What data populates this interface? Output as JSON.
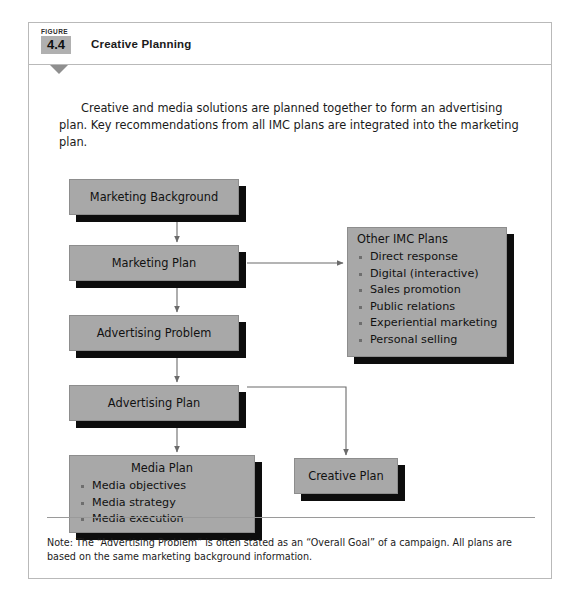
{
  "figure": {
    "badge_label": "FIGURE",
    "number": "4.4",
    "title": "Creative Planning",
    "intro": "Creative and media solutions are planned together to form an advertising plan. Key recommendations from all IMC plans are integrated into the marketing plan.",
    "note": "Note: The “Advertising Problem” is often stated as an “Overall Goal” of a campaign. All plans are based on the same marketing background information."
  },
  "diagram": {
    "type": "flowchart",
    "nodes": {
      "marketing_background": {
        "label": "Marketing Background"
      },
      "marketing_plan": {
        "label": "Marketing Plan"
      },
      "advertising_problem": {
        "label": "Advertising Problem"
      },
      "advertising_plan": {
        "label": "Advertising Plan"
      },
      "media_plan": {
        "label": "Media Plan",
        "items": [
          "Media objectives",
          "Media strategy",
          "Media execution"
        ]
      },
      "other_imc_plans": {
        "label": "Other IMC Plans",
        "items": [
          "Direct response",
          "Digital (interactive)",
          "Sales promotion",
          "Public relations",
          "Experiential marketing",
          "Personal selling"
        ]
      },
      "creative_plan": {
        "label": "Creative Plan"
      }
    },
    "edges": [
      {
        "from": "marketing_background",
        "to": "marketing_plan"
      },
      {
        "from": "marketing_plan",
        "to": "advertising_problem"
      },
      {
        "from": "marketing_plan",
        "to": "other_imc_plans"
      },
      {
        "from": "advertising_problem",
        "to": "advertising_plan"
      },
      {
        "from": "advertising_plan",
        "to": "media_plan"
      },
      {
        "from": "advertising_plan",
        "to": "creative_plan"
      }
    ],
    "colors": {
      "node_fill": "#a8a8a8",
      "node_shadow": "#0d0d0d",
      "connector": "#6b6b6b",
      "badge_fill": "#b0b0b0",
      "card_border": "#b9b9b9"
    }
  }
}
